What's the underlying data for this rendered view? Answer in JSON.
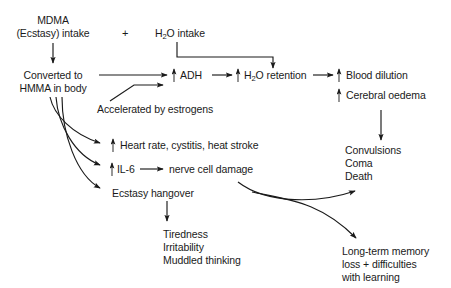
{
  "diagram": {
    "background_color": "#ffffff",
    "line_color": "#1a1a1a",
    "text_color": "#1a1a1a",
    "nodes": {
      "mdma_line1": "MDMA",
      "mdma_line2": "(Ecstasy) intake",
      "plus": "+",
      "h2o_intake_pre": "H",
      "h2o_intake_sub": "2",
      "h2o_intake_post": "O intake",
      "converted_line1": "Converted to",
      "converted_line2": "HMMA in body",
      "adh": "ADH",
      "h2o_retention_pre": "H",
      "h2o_retention_sub": "2",
      "h2o_retention_post": "O retention",
      "blood_dilution": "Blood dilution",
      "cerebral_oedema": "Cerebral oedema",
      "accelerated": "Accelerated by estrogens",
      "heart_rate": "Heart rate, cystitis, heat stroke",
      "il6": "IL-6",
      "nerve_damage": "nerve cell damage",
      "ecstasy_hangover": "Ecstasy hangover",
      "convulsions": "Convulsions",
      "coma": "Coma",
      "death": "Death",
      "tiredness": "Tiredness",
      "irritability": "Irritability",
      "muddled": "Muddled thinking",
      "longterm_line1": "Long-term memory",
      "longterm_line2": "loss + difficulties",
      "longterm_line3": "with learning"
    },
    "up_arrow_markers": [
      "adh-increase",
      "h2o-retention-increase",
      "blood-dilution-increase",
      "cerebral-oedema-increase",
      "heart-rate-increase",
      "il6-increase"
    ]
  }
}
